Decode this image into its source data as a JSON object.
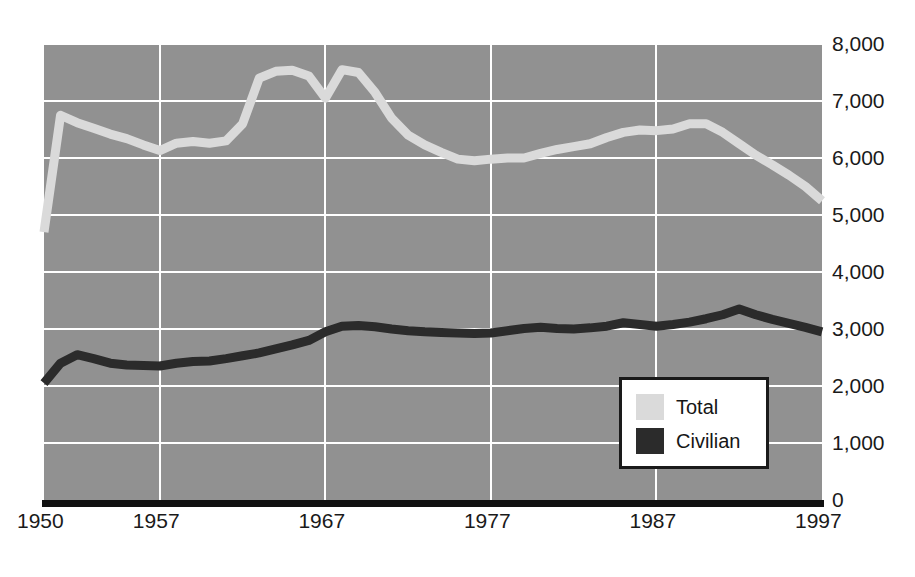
{
  "chart_data": {
    "type": "line",
    "title": "",
    "xlabel": "",
    "ylabel": "",
    "xlim": [
      1950,
      1997
    ],
    "ylim": [
      0,
      8000
    ],
    "grid": true,
    "legend_position": "bottom-right",
    "x_tick_labels": [
      "1950",
      "1957",
      "1967",
      "1977",
      "1987",
      "1997"
    ],
    "x_tick_values": [
      1950,
      1957,
      1967,
      1977,
      1987,
      1997
    ],
    "y_tick_labels": [
      "8,000",
      "7,000",
      "6,000",
      "5,000",
      "4,000",
      "3,000",
      "2,000",
      "1,000",
      "0"
    ],
    "y_tick_values": [
      8000,
      7000,
      6000,
      5000,
      4000,
      3000,
      2000,
      1000,
      0
    ],
    "x": [
      1950,
      1951,
      1952,
      1953,
      1954,
      1955,
      1956,
      1957,
      1958,
      1959,
      1960,
      1961,
      1962,
      1963,
      1964,
      1965,
      1966,
      1967,
      1968,
      1969,
      1970,
      1971,
      1972,
      1973,
      1974,
      1975,
      1976,
      1977,
      1978,
      1979,
      1980,
      1981,
      1982,
      1983,
      1984,
      1985,
      1986,
      1987,
      1988,
      1989,
      1990,
      1991,
      1992,
      1993,
      1994,
      1995,
      1996,
      1997
    ],
    "series": [
      {
        "name": "Total",
        "color": "#dadada",
        "values": [
          4700,
          6750,
          6620,
          6520,
          6420,
          6340,
          6230,
          6130,
          6260,
          6290,
          6260,
          6300,
          6600,
          7400,
          7520,
          7540,
          7440,
          7050,
          7550,
          7500,
          7150,
          6700,
          6400,
          6230,
          6100,
          5980,
          5950,
          5980,
          6000,
          6000,
          6080,
          6150,
          6200,
          6250,
          6360,
          6450,
          6490,
          6480,
          6510,
          6600,
          6600,
          6450,
          6250,
          6050,
          5880,
          5700,
          5500,
          5250
        ]
      },
      {
        "name": "Civilian",
        "color": "#2b2b2b",
        "values": [
          2050,
          2400,
          2550,
          2480,
          2400,
          2370,
          2360,
          2350,
          2400,
          2430,
          2440,
          2480,
          2530,
          2580,
          2650,
          2720,
          2800,
          2950,
          3050,
          3060,
          3040,
          3000,
          2970,
          2950,
          2940,
          2930,
          2920,
          2930,
          2970,
          3010,
          3030,
          3010,
          3000,
          3020,
          3050,
          3110,
          3080,
          3050,
          3080,
          3120,
          3180,
          3250,
          3350,
          3250,
          3170,
          3100,
          3030,
          2950
        ]
      }
    ]
  },
  "legend": {
    "items": [
      {
        "label": "Total",
        "swatch": "total"
      },
      {
        "label": "Civilian",
        "swatch": "civilian"
      }
    ]
  },
  "colors": {
    "plot_background": "#919191",
    "gridline": "#ffffff",
    "axis_line": "#111111",
    "total_line": "#dadada",
    "civilian_line": "#2b2b2b",
    "page_background": "#ffffff",
    "text": "#1a1a1a"
  }
}
